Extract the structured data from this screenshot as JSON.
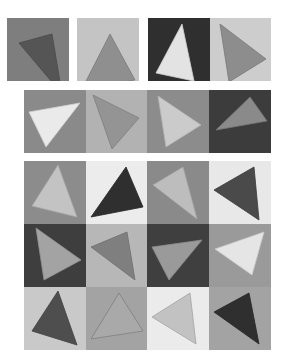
{
  "figure": {
    "groups": [
      {
        "name": "row-1-separate-pairs",
        "tiles": [
          {
            "x": 7,
            "y": 18,
            "w": 62,
            "h": 63,
            "bg": "#7e7e7e",
            "fill": "#555555",
            "stroke": "#4a4a4a",
            "points": "12,25 45,16 55,76"
          },
          {
            "x": 77,
            "y": 18,
            "w": 62,
            "h": 63,
            "bg": "#c4c4c4",
            "fill": "#8f8f8f",
            "stroke": "#7a7a7a",
            "points": "33,16 58,62 5,71"
          },
          {
            "x": 148,
            "y": 18,
            "w": 62,
            "h": 63,
            "bg": "#2f2f2f",
            "fill": "#e3e3e3",
            "stroke": "#d0d0d0",
            "points": "34,6 46,63 8,55"
          },
          {
            "x": 210,
            "y": 18,
            "w": 61,
            "h": 63,
            "bg": "#cdcdcd",
            "fill": "#8d8d8d",
            "stroke": "#787878",
            "points": "10,6 56,41 19,64"
          }
        ]
      },
      {
        "name": "row-2-strip",
        "tiles": [
          {
            "x": 24,
            "y": 90,
            "w": 62,
            "h": 63,
            "bg": "#8a8a8a",
            "fill": "#eaeaea",
            "stroke": "#cfcfcf",
            "points": "5,22 56,13 22,57"
          },
          {
            "x": 86,
            "y": 90,
            "w": 61,
            "h": 63,
            "bg": "#b2b2b2",
            "fill": "#949494",
            "stroke": "#7e7e7e",
            "points": "7,5 53,28 26,59"
          },
          {
            "x": 147,
            "y": 90,
            "w": 62,
            "h": 63,
            "bg": "#8c8c8c",
            "fill": "#cbcbcb",
            "stroke": "#b4b4b4",
            "points": "11,6 54,35 19,57"
          },
          {
            "x": 209,
            "y": 90,
            "w": 62,
            "h": 63,
            "bg": "#3c3c3c",
            "fill": "#8a8a8a",
            "stroke": "#777777",
            "points": "41,7 58,31 7,40"
          }
        ]
      },
      {
        "name": "grid-4x3",
        "tiles": [
          {
            "x": 24,
            "y": 161,
            "w": 62,
            "h": 63,
            "bg": "#8c8c8c",
            "fill": "#c3c3c3",
            "stroke": "#a8a8a8",
            "points": "34,4 53,56 8,45"
          },
          {
            "x": 86,
            "y": 161,
            "w": 61,
            "h": 63,
            "bg": "#ececec",
            "fill": "#2f2f2f",
            "stroke": "#252525",
            "points": "40,6 57,46 5,56"
          },
          {
            "x": 147,
            "y": 161,
            "w": 62,
            "h": 63,
            "bg": "#8a8a8a",
            "fill": "#bdbdbd",
            "stroke": "#a7a7a7",
            "points": "36,6 50,58 6,24"
          },
          {
            "x": 209,
            "y": 161,
            "w": 62,
            "h": 63,
            "bg": "#e8e8e8",
            "fill": "#4a4a4a",
            "stroke": "#3a3a3a",
            "points": "45,6 50,59 5,29"
          },
          {
            "x": 24,
            "y": 224,
            "w": 62,
            "h": 63,
            "bg": "#3e3e3e",
            "fill": "#a3a3a3",
            "stroke": "#929292",
            "points": "12,4 57,36 20,56"
          },
          {
            "x": 86,
            "y": 224,
            "w": 61,
            "h": 63,
            "bg": "#b7b7b7",
            "fill": "#7f7f7f",
            "stroke": "#6f6f6f",
            "points": "5,23 41,8 49,56"
          },
          {
            "x": 147,
            "y": 224,
            "w": 62,
            "h": 63,
            "bg": "#3f3f3f",
            "fill": "#9a9a9a",
            "stroke": "#8a8a8a",
            "points": "5,23 55,16 22,56"
          },
          {
            "x": 209,
            "y": 224,
            "w": 62,
            "h": 63,
            "bg": "#9a9a9a",
            "fill": "#e5e5e5",
            "stroke": "#cacaca",
            "points": "6,25 55,8 43,51"
          },
          {
            "x": 24,
            "y": 287,
            "w": 62,
            "h": 63,
            "bg": "#c9c9c9",
            "fill": "#4e4e4e",
            "stroke": "#404040",
            "points": "34,4 53,58 8,44"
          },
          {
            "x": 86,
            "y": 287,
            "w": 61,
            "h": 63,
            "bg": "#a3a3a3",
            "fill": "#a9a9a9",
            "stroke": "#7f7f7f",
            "points": "33,6 57,44 5,52"
          },
          {
            "x": 147,
            "y": 287,
            "w": 62,
            "h": 63,
            "bg": "#ebebeb",
            "fill": "#c2c2c2",
            "stroke": "#a3a3a3",
            "points": "43,6 49,57 5,30"
          },
          {
            "x": 209,
            "y": 287,
            "w": 62,
            "h": 63,
            "bg": "#a3a3a3",
            "fill": "#2f2f2f",
            "stroke": "#262626",
            "points": "40,6 50,57 5,25"
          }
        ]
      }
    ]
  }
}
